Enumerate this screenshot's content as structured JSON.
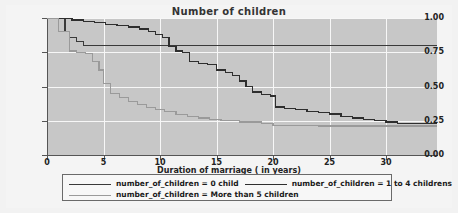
{
  "chart_data": {
    "type": "line",
    "title": "Number of children",
    "xlabel": "Duration of marriage ( in years)",
    "ylabel": "",
    "xlim": [
      0,
      34.5
    ],
    "ylim": [
      0,
      1.0
    ],
    "xticks": [
      0,
      5,
      10,
      15,
      20,
      25,
      30
    ],
    "yticks": [
      0.0,
      0.25,
      0.5,
      0.75,
      1.0
    ],
    "ytick_labels": [
      "0.00",
      "0.25",
      "0.50",
      "0.75",
      "1.00"
    ],
    "xtick_labels": [
      "0",
      "5",
      "10",
      "15",
      "20",
      "25",
      "30"
    ],
    "grid": true,
    "legend_position": "below",
    "plot_background": "#c7c7c7",
    "grid_color": "#f7f7f7",
    "step_style": "post",
    "series": [
      {
        "name": "number_of_children = 0 child",
        "color": "#3a3a3a",
        "x": [
          0,
          1,
          1.6,
          2,
          2.6,
          3.2,
          34.5
        ],
        "values": [
          1.0,
          1.0,
          0.9,
          0.86,
          0.83,
          0.8,
          0.8
        ]
      },
      {
        "name": "number_of_children = 1 to 4 childrens",
        "color": "#2e2e2e",
        "x": [
          0,
          1.2,
          2.2,
          3.2,
          4.2,
          5.2,
          6.2,
          7.2,
          8.2,
          9.0,
          9.6,
          10.2,
          10.8,
          11.4,
          12.0,
          12.6,
          13.4,
          14.2,
          15.0,
          15.8,
          16.4,
          17.0,
          17.6,
          18.2,
          19.0,
          19.8,
          20.2,
          21.0,
          22.0,
          23.0,
          24.0,
          25.0,
          26.0,
          27.0,
          28.0,
          29.0,
          30.0,
          31.0,
          34.5
        ],
        "values": [
          1.0,
          0.995,
          0.985,
          0.975,
          0.965,
          0.955,
          0.945,
          0.935,
          0.92,
          0.9,
          0.88,
          0.86,
          0.79,
          0.76,
          0.75,
          0.68,
          0.67,
          0.66,
          0.62,
          0.6,
          0.58,
          0.54,
          0.5,
          0.46,
          0.44,
          0.43,
          0.35,
          0.34,
          0.33,
          0.32,
          0.31,
          0.3,
          0.28,
          0.27,
          0.26,
          0.25,
          0.24,
          0.23,
          0.23
        ]
      },
      {
        "name": "number_of_children = More than 5 children",
        "color": "#9a9a9a",
        "x": [
          0,
          1.0,
          2.0,
          2.6,
          3.4,
          4.0,
          4.6,
          5.0,
          5.6,
          6.4,
          7.2,
          8.0,
          8.8,
          9.6,
          10.4,
          11.4,
          12.4,
          13.4,
          14.4,
          15.4,
          17.0,
          19.0,
          20.0,
          24.0,
          28.0,
          34.5
        ],
        "values": [
          1.0,
          0.9,
          0.76,
          0.75,
          0.74,
          0.68,
          0.62,
          0.52,
          0.45,
          0.42,
          0.39,
          0.37,
          0.345,
          0.33,
          0.315,
          0.295,
          0.28,
          0.27,
          0.26,
          0.25,
          0.24,
          0.23,
          0.215,
          0.212,
          0.212,
          0.212
        ]
      }
    ]
  },
  "legend": {
    "entries": [
      {
        "label": "number_of_children = 0 child",
        "color": "#3a3a3a"
      },
      {
        "label": "number_of_children = 1 to 4 childrens",
        "color": "#2e2e2e"
      },
      {
        "label": "number_of_children = More than 5 children",
        "color": "#9a9a9a"
      }
    ]
  }
}
